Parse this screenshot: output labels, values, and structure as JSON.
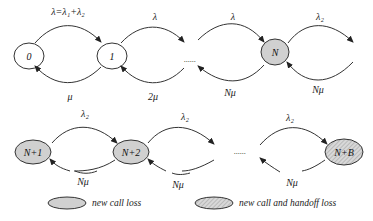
{
  "diagram": {
    "type": "markov-chain",
    "colors": {
      "loss_fill": "#d0d0d0",
      "stroke": "#333333",
      "white_fill": "#ffffff"
    },
    "row1": {
      "states": [
        {
          "id": "s0",
          "label": "0",
          "style": "white"
        },
        {
          "id": "s1",
          "label": "1",
          "style": "white"
        },
        {
          "id": "sN",
          "label": "N",
          "style": "gray"
        }
      ],
      "ellipsis": "......",
      "forward_labels": [
        "λ=λ1+λ2",
        "λ",
        "λ",
        "λ2"
      ],
      "forward_labels_display": [
        "λ=λ₁+λ₂",
        "λ",
        "λ",
        "λ₂"
      ],
      "backward_labels": [
        "μ",
        "2μ",
        "Nμ",
        "Nμ"
      ]
    },
    "row2": {
      "states": [
        {
          "id": "sN1",
          "label": "N+1",
          "style": "gray"
        },
        {
          "id": "sN2",
          "label": "N+2",
          "style": "gray"
        },
        {
          "id": "sNB",
          "label": "N+B",
          "style": "hatched"
        }
      ],
      "ellipsis": "......",
      "forward_labels": [
        "λ2",
        "λ2",
        "λ2"
      ],
      "forward_labels_display": [
        "λ₂",
        "λ₂",
        "λ₂"
      ],
      "backward_labels": [
        "Nμ",
        "Nμ",
        "Nμ"
      ]
    },
    "legend": [
      {
        "style": "gray",
        "label": "new call loss"
      },
      {
        "style": "hatched",
        "label": "new call and handoff loss"
      }
    ]
  }
}
